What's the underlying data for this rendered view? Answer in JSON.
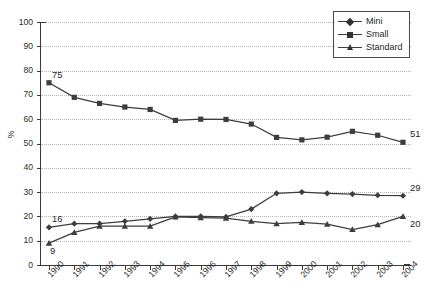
{
  "chart_data": {
    "type": "line",
    "title": "",
    "xlabel": "",
    "ylabel": "%",
    "ylim": [
      0,
      100
    ],
    "ytick_step": 10,
    "grid": true,
    "legend_position": "top-right",
    "categories": [
      "1990",
      "1991",
      "1992",
      "1993",
      "1994",
      "1995",
      "1996",
      "1997",
      "1998",
      "1999",
      "2000",
      "2001",
      "2002",
      "2003",
      "2004"
    ],
    "yticks": [
      "0",
      "10",
      "20",
      "30",
      "40",
      "50",
      "60",
      "70",
      "80",
      "90",
      "100"
    ],
    "series": [
      {
        "name": "Mini",
        "marker": "diamond",
        "color": "#3d3d3d",
        "values": [
          15.5,
          17,
          17,
          18,
          19,
          20,
          20,
          19.8,
          23,
          29.5,
          30,
          29.5,
          29.2,
          28.7,
          28.5
        ]
      },
      {
        "name": "Small",
        "marker": "square",
        "color": "#3d3d3d",
        "values": [
          75,
          69,
          66.5,
          65,
          64,
          59.5,
          60,
          59.9,
          58,
          52.5,
          51.5,
          52.6,
          55,
          53.4,
          50.5
        ]
      },
      {
        "name": "Standard",
        "marker": "triangle",
        "color": "#3d3d3d",
        "values": [
          9,
          13.4,
          16,
          16,
          16,
          19.8,
          19.5,
          19.3,
          18,
          17,
          17.5,
          16.8,
          14.6,
          16.6,
          20
        ]
      }
    ],
    "annotations": [
      {
        "text": "75",
        "series": "Small",
        "category": "1990",
        "value": 75,
        "placement": "above-left"
      },
      {
        "text": "16",
        "series": "Mini",
        "category": "1990",
        "value": 15.5,
        "placement": "above-left"
      },
      {
        "text": "9",
        "series": "Standard",
        "category": "1990",
        "value": 9,
        "placement": "below-left"
      },
      {
        "text": "51",
        "series": "Small",
        "category": "2004",
        "value": 50.5,
        "placement": "above-right"
      },
      {
        "text": "29",
        "series": "Mini",
        "category": "2004",
        "value": 28.5,
        "placement": "above-right"
      },
      {
        "text": "20",
        "series": "Standard",
        "category": "2004",
        "value": 20,
        "placement": "below-right"
      }
    ]
  },
  "legend": {
    "items": [
      {
        "label": "Mini",
        "marker": "diamond"
      },
      {
        "label": "Small",
        "marker": "square"
      },
      {
        "label": "Standard",
        "marker": "triangle"
      }
    ]
  }
}
